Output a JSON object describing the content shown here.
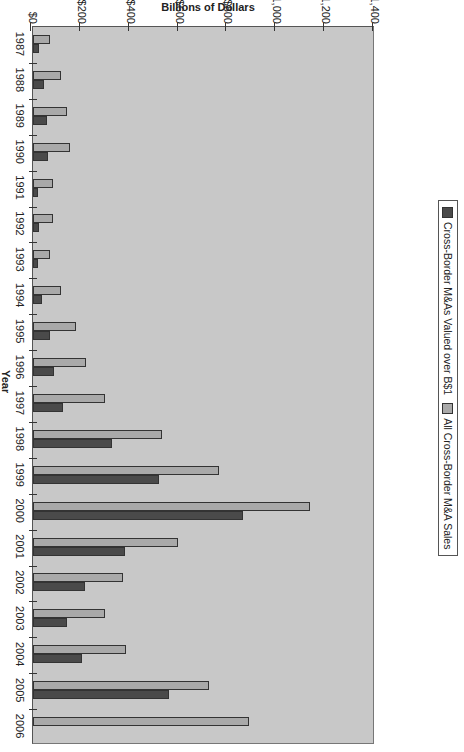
{
  "chart_data": {
    "type": "bar",
    "orientation_note": "image rotated 90 degrees",
    "title": "",
    "xlabel": "Year",
    "ylabel": "Billions of Dollars",
    "ylim": [
      0,
      1400
    ],
    "yticks": [
      "$0",
      "$200",
      "$400",
      "$600",
      "$800",
      "$1,000",
      "$1,200",
      "$1,400"
    ],
    "categories": [
      "1987",
      "1988",
      "1989",
      "1990",
      "1991",
      "1992",
      "1993",
      "1994",
      "1995",
      "1996",
      "1997",
      "1998",
      "1999",
      "2000",
      "2001",
      "2002",
      "2003",
      "2004",
      "2005",
      "2006"
    ],
    "series": [
      {
        "name": "Cross-Border M&As Valued over B$1",
        "color": "#4a4a4a",
        "values": [
          25,
          45,
          58,
          62,
          21,
          25,
          20,
          37,
          70,
          86,
          123,
          323,
          516,
          860,
          377,
          213,
          140,
          200,
          557,
          0
        ]
      },
      {
        "name": "All Cross-Border M&A Sales",
        "color": "#a9a9a9",
        "values": [
          70,
          116,
          140,
          153,
          83,
          83,
          70,
          115,
          176,
          217,
          295,
          528,
          761,
          1134,
          593,
          368,
          295,
          381,
          720,
          884
        ]
      }
    ],
    "grid": false,
    "legend_position": "bottom"
  },
  "legend": {
    "item1": "Cross-Border M&As Valued over B$1",
    "item2": "All Cross-Border M&A Sales"
  },
  "axis": {
    "x_title": "Year",
    "y_title": "Billions of Dollars"
  }
}
